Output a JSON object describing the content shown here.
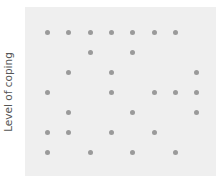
{
  "chart_data": {
    "type": "scatter",
    "title": "",
    "xlabel": "",
    "ylabel": "Level of coping",
    "grid": false,
    "legend": null,
    "x_positions_px": [
      47.7,
      68.9,
      90.2,
      111.5,
      132.8,
      154.1,
      175.4,
      196.7
    ],
    "y_positions_px": [
      32.3,
      52.3,
      72.2,
      92.1,
      112.1,
      132.2,
      152.3
    ],
    "points": [
      {
        "col": 0,
        "row": 0
      },
      {
        "col": 1,
        "row": 0
      },
      {
        "col": 2,
        "row": 0
      },
      {
        "col": 3,
        "row": 0
      },
      {
        "col": 4,
        "row": 0
      },
      {
        "col": 5,
        "row": 0
      },
      {
        "col": 6,
        "row": 0
      },
      {
        "col": 2,
        "row": 1
      },
      {
        "col": 4,
        "row": 1
      },
      {
        "col": 1,
        "row": 2
      },
      {
        "col": 3,
        "row": 2
      },
      {
        "col": 7,
        "row": 2
      },
      {
        "col": 0,
        "row": 3
      },
      {
        "col": 3,
        "row": 3
      },
      {
        "col": 5,
        "row": 3
      },
      {
        "col": 6,
        "row": 3
      },
      {
        "col": 7,
        "row": 3
      },
      {
        "col": 1,
        "row": 4
      },
      {
        "col": 4,
        "row": 4
      },
      {
        "col": 7,
        "row": 4
      },
      {
        "col": 0,
        "row": 5
      },
      {
        "col": 1,
        "row": 5
      },
      {
        "col": 3,
        "row": 5
      },
      {
        "col": 5,
        "row": 5
      },
      {
        "col": 0,
        "row": 6
      },
      {
        "col": 2,
        "row": 6
      },
      {
        "col": 4,
        "row": 6
      },
      {
        "col": 6,
        "row": 6
      }
    ],
    "colors": {
      "dot": "#9a9a9a",
      "plot_background": "#efefef",
      "page_background": "#ffffff"
    }
  }
}
